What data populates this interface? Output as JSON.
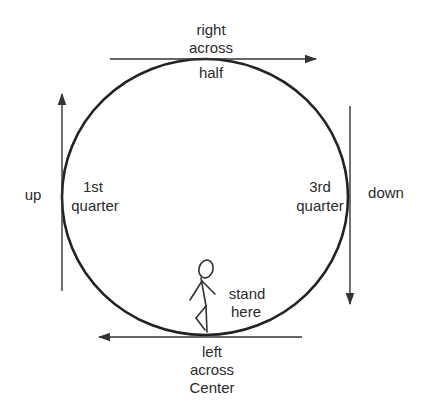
{
  "diagram": {
    "colors": {
      "stroke": "#222222",
      "arrow": "#333333",
      "text": "#2a2a2a",
      "background": "#ffffff"
    },
    "circle": {
      "cx": 205,
      "cy": 197,
      "rx": 143,
      "ry": 138
    },
    "arrows": {
      "top": {
        "direction": "right",
        "label_lines": [
          "right",
          "across"
        ],
        "below_label": "half"
      },
      "left": {
        "direction": "up",
        "label": "up"
      },
      "right": {
        "direction": "down",
        "label": "down"
      },
      "bottom": {
        "direction": "left",
        "label_lines": [
          "left",
          "across",
          "Center"
        ]
      }
    },
    "labels": {
      "top_line1": "right",
      "top_line2": "across",
      "top_below": "half",
      "left_outer": "up",
      "left_inner_line1": "1st",
      "left_inner_line2": "quarter",
      "right_inner_line1": "3rd",
      "right_inner_line2": "quarter",
      "right_outer": "down",
      "figure_line1": "stand",
      "figure_line2": "here",
      "bottom_line1": "left",
      "bottom_line2": "across",
      "bottom_line3": "Center"
    },
    "figure": {
      "description": "stick-figure",
      "position": "bottom-center-inside-circle"
    }
  }
}
